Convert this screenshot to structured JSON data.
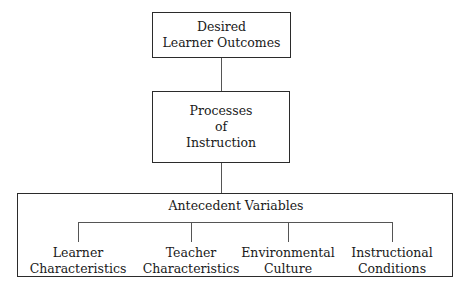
{
  "diagram": {
    "background_color": "#ffffff",
    "line_color": "#555555",
    "border_color": "#2b2b2b",
    "text_color": "#1a1a1a",
    "nodes": {
      "outcomes": {
        "line1": "Desired",
        "line2": "Learner Outcomes"
      },
      "processes": {
        "line1": "Processes",
        "line2": "of",
        "line3": "Instruction"
      },
      "antecedent": {
        "title": "Antecedent Variables"
      }
    },
    "leaves": [
      {
        "line1": "Learner",
        "line2": "Characteristics"
      },
      {
        "line1": "Teacher",
        "line2": "Characteristics"
      },
      {
        "line1": "Environmental",
        "line2": "Culture"
      },
      {
        "line1": "Instructional",
        "line2": "Conditions"
      }
    ]
  }
}
